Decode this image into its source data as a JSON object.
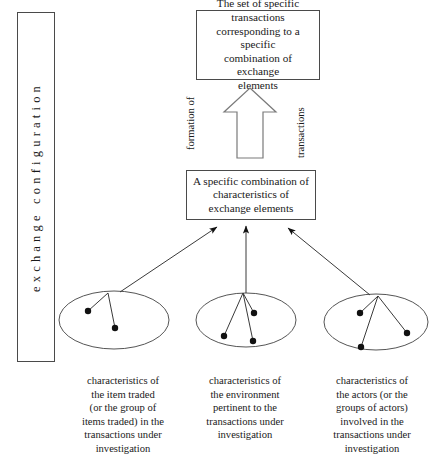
{
  "figure": {
    "side_label": "exchange configuration",
    "top_box": {
      "lines": [
        "The set of specific",
        "transactions",
        "corresponding to a specific",
        "combination of exchange",
        "elements"
      ]
    },
    "middle_box": {
      "lines": [
        "A specific combination of",
        "characteristics of",
        "exchange elements"
      ]
    },
    "flank_labels": {
      "left": "formation of",
      "right": "transactions"
    },
    "captions": {
      "left": [
        "characteristics of",
        "the item traded",
        "(or the group of",
        "items traded) in the",
        "transactions under",
        "investigation"
      ],
      "middle": [
        "characteristics of",
        "the environment",
        "pertinent to the",
        "transactions under",
        "investigation"
      ],
      "right": [
        "characteristics of",
        "the actors (or the",
        "groups of actors)",
        "involved in the",
        "transactions under",
        "investigation"
      ]
    },
    "groups": [
      {
        "name": "items-traded-group",
        "dot_count": 2
      },
      {
        "name": "environment-group",
        "dot_count": 3
      },
      {
        "name": "actors-group",
        "dot_count": 3
      }
    ],
    "colors": {
      "stroke": "#4a4a4a",
      "line": "#3a3a3a",
      "dot": "#111111",
      "background": "#ffffff"
    }
  }
}
